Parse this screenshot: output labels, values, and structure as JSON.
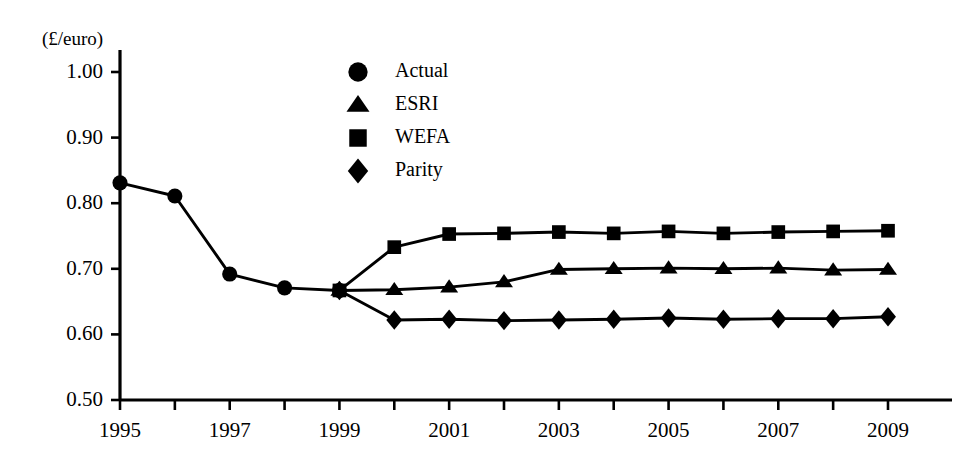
{
  "chart_data": {
    "type": "line",
    "title": "",
    "subtitle": "",
    "xlabel": "",
    "ylabel": "(£/euro)",
    "ylabel_position": "top-left",
    "grid": false,
    "legend_position": "top-center",
    "x": [
      1995,
      1996,
      1997,
      1998,
      1999,
      2000,
      2001,
      2002,
      2003,
      2004,
      2005,
      2006,
      2007,
      2008,
      2009
    ],
    "xlim": [
      1995,
      2009
    ],
    "ylim": [
      0.5,
      1.0
    ],
    "ytick_values": [
      1.0,
      0.9,
      0.8,
      0.7,
      0.6,
      0.5
    ],
    "ytick_labels": [
      "1.00",
      "0.90",
      "0.80",
      "0.70",
      "0.60",
      "0.50"
    ],
    "xtick_values": [
      1995,
      1996,
      1997,
      1998,
      1999,
      2000,
      2001,
      2002,
      2003,
      2004,
      2005,
      2006,
      2007,
      2008,
      2009
    ],
    "xtick_labels": [
      "1995",
      "",
      "1997",
      "",
      "1999",
      "",
      "2001",
      "",
      "2003",
      "",
      "2005",
      "",
      "2007",
      "",
      "2009"
    ],
    "series": [
      {
        "name": "Actual",
        "marker": "circle",
        "x": [
          1995,
          1996,
          1997,
          1998,
          1999
        ],
        "values": [
          0.831,
          0.811,
          0.692,
          0.671,
          0.667
        ]
      },
      {
        "name": "ESRI",
        "marker": "triangle",
        "x": [
          1999,
          2000,
          2001,
          2002,
          2003,
          2004,
          2005,
          2006,
          2007,
          2008,
          2009
        ],
        "values": [
          0.667,
          0.668,
          0.672,
          0.68,
          0.699,
          0.7,
          0.701,
          0.7,
          0.701,
          0.698,
          0.699
        ]
      },
      {
        "name": "WEFA",
        "marker": "square",
        "x": [
          1999,
          2000,
          2001,
          2002,
          2003,
          2004,
          2005,
          2006,
          2007,
          2008,
          2009
        ],
        "values": [
          0.667,
          0.733,
          0.753,
          0.754,
          0.756,
          0.754,
          0.757,
          0.754,
          0.756,
          0.757,
          0.758
        ]
      },
      {
        "name": "Parity",
        "marker": "diamond",
        "x": [
          1999,
          2000,
          2001,
          2002,
          2003,
          2004,
          2005,
          2006,
          2007,
          2008,
          2009
        ],
        "values": [
          0.667,
          0.622,
          0.623,
          0.621,
          0.622,
          0.623,
          0.625,
          0.623,
          0.624,
          0.624,
          0.627
        ]
      }
    ],
    "legend": [
      {
        "label": "Actual",
        "marker": "circle"
      },
      {
        "label": "ESRI",
        "marker": "triangle"
      },
      {
        "label": "WEFA",
        "marker": "square"
      },
      {
        "label": "Parity",
        "marker": "diamond"
      }
    ],
    "colors": {
      "series": "#000000",
      "axis": "#000000",
      "background": "#ffffff"
    }
  },
  "axis": {
    "unit_label": "(£/euro)"
  }
}
